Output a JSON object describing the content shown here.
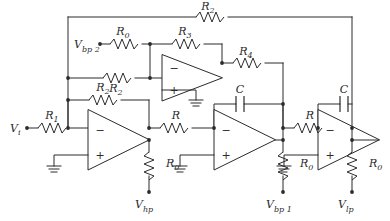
{
  "figure": {
    "kind": "schematic",
    "stroke_color": "#2b2b2b",
    "background_color": "#ffffff",
    "line_width": 1
  },
  "nodes": {
    "input_label": "V",
    "input_sub": "i",
    "bp2_label": "V",
    "bp2_sub": "bp 2",
    "hp_label": "V",
    "hp_sub": "hp",
    "bp1_label": "V",
    "bp1_sub": "bp 1",
    "lp_label": "V",
    "lp_sub": "lp"
  },
  "components": {
    "r_top_feedback": {
      "name": "R",
      "sub": "2",
      "type": "resistor"
    },
    "r0_bp2": {
      "name": "R",
      "sub": "0",
      "type": "resistor"
    },
    "r3": {
      "name": "R",
      "sub": "3",
      "type": "resistor"
    },
    "r2_inv": {
      "name": "R",
      "sub": "2",
      "type": "resistor"
    },
    "r4": {
      "name": "R",
      "sub": "4",
      "type": "resistor"
    },
    "r2_hp_feedback": {
      "name": "R",
      "sub": "2",
      "type": "resistor"
    },
    "r1_input": {
      "name": "R",
      "sub": "1",
      "type": "resistor"
    },
    "r0_hp": {
      "name": "R",
      "sub": "0",
      "type": "resistor"
    },
    "r_int1": {
      "name": "R",
      "sub": "",
      "type": "resistor"
    },
    "c_int1": {
      "name": "C",
      "sub": "",
      "type": "capacitor"
    },
    "r0_bp1": {
      "name": "R",
      "sub": "0",
      "type": "resistor"
    },
    "r_int2": {
      "name": "R",
      "sub": "",
      "type": "resistor"
    },
    "c_int2": {
      "name": "C",
      "sub": "",
      "type": "capacitor"
    },
    "r0_lp": {
      "name": "R",
      "sub": "0",
      "type": "resistor"
    }
  },
  "opamps": [
    {
      "id": "summer",
      "minus": "−",
      "plus": "+",
      "ground": true
    },
    {
      "id": "inverter",
      "minus": "−",
      "plus": "+",
      "ground": true
    },
    {
      "id": "integrator1",
      "minus": "−",
      "plus": "+",
      "ground": true
    },
    {
      "id": "integrator2",
      "minus": "−",
      "plus": "+",
      "ground": true
    }
  ],
  "symbols": {
    "minus": "−",
    "plus": "+"
  }
}
